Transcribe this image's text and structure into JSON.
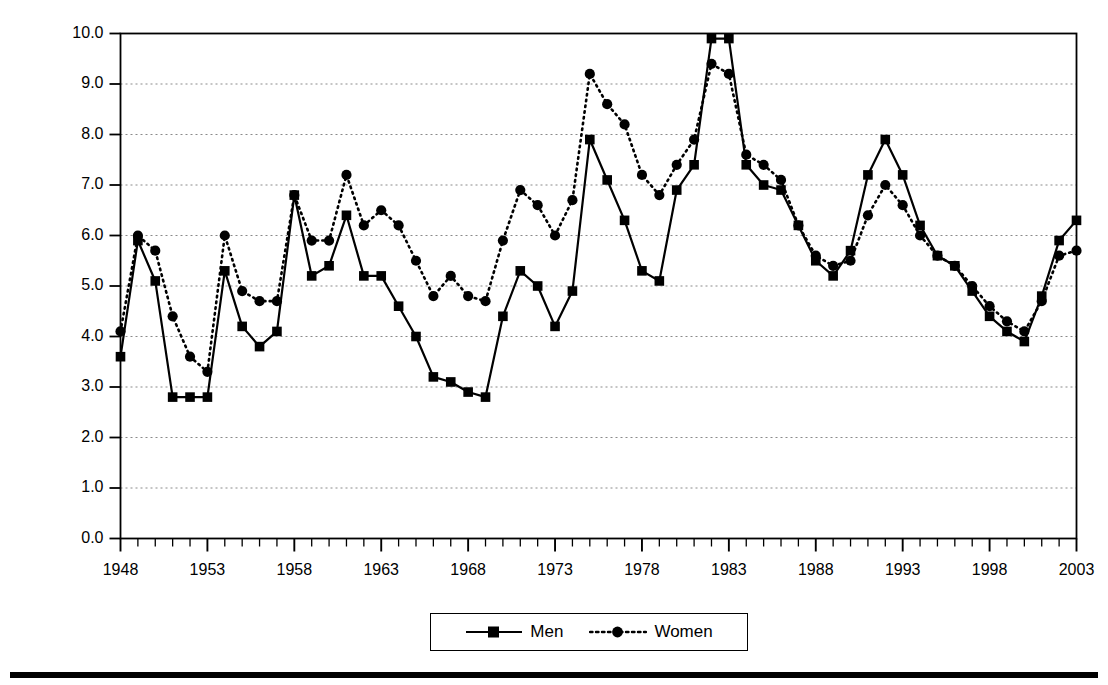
{
  "chart_data": {
    "type": "line",
    "title": "",
    "xlabel": "",
    "ylabel": "Percent",
    "xlim": [
      1948,
      2003
    ],
    "ylim": [
      0.0,
      10.0
    ],
    "grid": true,
    "legend_position": "bottom-center",
    "y_ticks": [
      "0.0",
      "1.0",
      "2.0",
      "3.0",
      "4.0",
      "5.0",
      "6.0",
      "7.0",
      "8.0",
      "9.0",
      "10.0"
    ],
    "y_tick_values": [
      0.0,
      1.0,
      2.0,
      3.0,
      4.0,
      5.0,
      6.0,
      7.0,
      8.0,
      9.0,
      10.0
    ],
    "x_ticks": [
      "1948",
      "1953",
      "1958",
      "1963",
      "1968",
      "1973",
      "1978",
      "1983",
      "1988",
      "1993",
      "1998",
      "2003"
    ],
    "x_tick_values": [
      1948,
      1953,
      1958,
      1963,
      1968,
      1973,
      1978,
      1983,
      1988,
      1993,
      1998,
      2003
    ],
    "x": [
      1948,
      1949,
      1950,
      1951,
      1952,
      1953,
      1954,
      1955,
      1956,
      1957,
      1958,
      1959,
      1960,
      1961,
      1962,
      1963,
      1964,
      1965,
      1966,
      1967,
      1968,
      1969,
      1970,
      1971,
      1972,
      1973,
      1974,
      1975,
      1976,
      1977,
      1978,
      1979,
      1980,
      1981,
      1982,
      1983,
      1984,
      1985,
      1986,
      1987,
      1988,
      1989,
      1990,
      1991,
      1992,
      1993,
      1994,
      1995,
      1996,
      1997,
      1998,
      1999,
      2000,
      2001,
      2002,
      2003
    ],
    "series": [
      {
        "name": "Men",
        "marker": "square",
        "line_style": "solid",
        "color": "#000000",
        "values": [
          3.6,
          5.9,
          5.1,
          2.8,
          2.8,
          2.8,
          5.3,
          4.2,
          3.8,
          4.1,
          6.8,
          5.2,
          5.4,
          6.4,
          5.2,
          5.2,
          4.6,
          4.0,
          3.2,
          3.1,
          2.9,
          2.8,
          4.4,
          5.3,
          5.0,
          4.2,
          4.9,
          7.9,
          7.1,
          6.3,
          5.3,
          5.1,
          6.9,
          7.4,
          9.9,
          9.9,
          7.4,
          7.0,
          6.9,
          6.2,
          5.5,
          5.2,
          5.7,
          7.2,
          7.9,
          7.2,
          6.2,
          5.6,
          5.4,
          4.9,
          4.4,
          4.1,
          3.9,
          4.8,
          5.9,
          6.3
        ]
      },
      {
        "name": "Women",
        "marker": "circle",
        "line_style": "dotted",
        "color": "#000000",
        "values": [
          4.1,
          6.0,
          5.7,
          4.4,
          3.6,
          3.3,
          6.0,
          4.9,
          4.7,
          4.7,
          6.8,
          5.9,
          5.9,
          7.2,
          6.2,
          6.5,
          6.2,
          5.5,
          4.8,
          5.2,
          4.8,
          4.7,
          5.9,
          6.9,
          6.6,
          6.0,
          6.7,
          9.2,
          8.6,
          8.2,
          7.2,
          6.8,
          7.4,
          7.9,
          9.4,
          9.2,
          7.6,
          7.4,
          7.1,
          6.2,
          5.6,
          5.4,
          5.5,
          6.4,
          7.0,
          6.6,
          6.0,
          5.6,
          5.4,
          5.0,
          4.6,
          4.3,
          4.1,
          4.7,
          5.6,
          5.7
        ]
      }
    ],
    "legend": [
      {
        "label": "Men",
        "marker": "square",
        "line_style": "solid"
      },
      {
        "label": "Women",
        "marker": "circle",
        "line_style": "dotted"
      }
    ]
  }
}
